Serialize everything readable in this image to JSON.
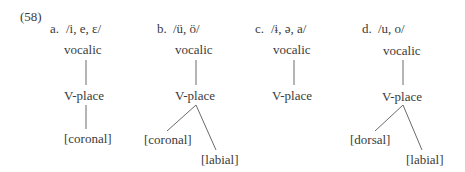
{
  "example_number": "(58)",
  "trees": [
    {
      "label": "a.",
      "segments": "/i, e, ɛ/",
      "root": "vocalic",
      "place": "V-place",
      "features": [
        "[coronal]"
      ]
    },
    {
      "label": "b.",
      "segments": "/ü, ö/",
      "root": "vocalic",
      "place": "V-place",
      "features": [
        "[coronal]",
        "[labial]"
      ]
    },
    {
      "label": "c.",
      "segments": "/ɨ, ə, a/",
      "root": "vocalic",
      "place": "V-place",
      "features": []
    },
    {
      "label": "d.",
      "segments": "/u, o/",
      "root": "vocalic",
      "place": "V-place",
      "features": [
        "[dorsal]",
        "[labial]"
      ]
    }
  ]
}
